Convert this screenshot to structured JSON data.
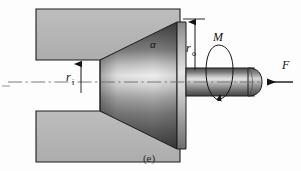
{
  "figure": {
    "caption": "(e)"
  },
  "labels": {
    "inner_radius": {
      "symbol": "r",
      "subscript": "i",
      "text": "r"
    },
    "outer_radius": {
      "symbol": "r",
      "subscript": "o",
      "text": "r"
    },
    "cone_angle": {
      "symbol": "α",
      "text": "α"
    },
    "moment": {
      "symbol": "M",
      "text": "M"
    },
    "force": {
      "symbol": "F",
      "text": "F"
    }
  },
  "colors": {
    "background": "#fdfdfd",
    "block_fill": "#b6b6b6",
    "block_edge": "#1c1c1c",
    "cone_dark": "#4a4a4a",
    "cone_mid": "#9a9a9a",
    "cone_highlight": "#e8e8e8",
    "shaft_dark": "#5a5a5a",
    "shaft_highlight": "#dcdcdc",
    "line": "#141414",
    "centerline": "#6b6b6b",
    "text": "#101010"
  },
  "geometry": {
    "upper_block": "M36,9 L180,9 L180,31 L100,60 L36,60 Z",
    "lower_block": "M36,111 L100,111 L180,140 L180,162 L36,162 Z",
    "cone_face_top_y": 22,
    "cone_face_bottom_y": 149,
    "shaft_top_y": 68,
    "shaft_bottom_y": 96,
    "axis_y": 82
  },
  "annotations": {
    "axis_line_style": "dash-dot centerline",
    "force_direction": "leftward axial arrow",
    "moment_direction": "torsional arrow about shaft axis",
    "dimension_ri": "vertical leader from axis to lower edge of upper block",
    "dimension_ro": "vertical leader from axis to top of cone large face"
  }
}
